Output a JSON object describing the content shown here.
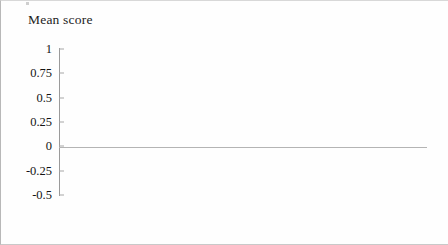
{
  "chart_data": {
    "type": "bar",
    "title": "Mean score",
    "xlabel": "",
    "ylabel": "Mean score",
    "categories": [
      "Year 9 Girls",
      "Year 9 Boys",
      "Year 10 Girls",
      "Year 10 Boys"
    ],
    "values": [
      0.78,
      0.97,
      -0.23,
      0.19
    ],
    "bar_colors": [
      "#9d9d9d",
      "#2a2a2a",
      "#9d9d9d",
      "#2a2a2a"
    ],
    "ylim": [
      -0.5,
      1
    ],
    "ytick_labels": [
      "1",
      "0.75",
      "0.5",
      "0.25",
      "0",
      "-0.25",
      "-0.5"
    ],
    "ytick_values": [
      1,
      0.75,
      0.5,
      0.25,
      0,
      -0.25,
      -0.5
    ],
    "grid": false,
    "legend": null,
    "zero_line": 0
  },
  "figure": {
    "axis_title": "Mean score",
    "background_color": "#fefefe",
    "axis_color": "#9a9a9a",
    "baseline_color": "#b4b4b4",
    "bar_outline_color": "#161616",
    "light_bar_color": "#9d9d9d",
    "dark_bar_color": "#2a2a2a"
  }
}
